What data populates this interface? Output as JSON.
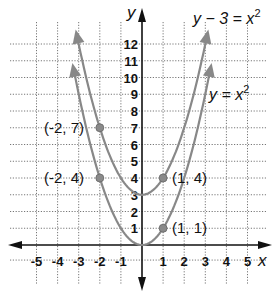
{
  "chart_data": {
    "type": "line",
    "title": "",
    "xlabel": "x",
    "ylabel": "y",
    "xlim": [
      -5,
      5
    ],
    "ylim": [
      0,
      12
    ],
    "grid": true,
    "x_ticks": [
      "-5",
      "-4",
      "-3",
      "-2",
      "-1",
      "1",
      "2",
      "3",
      "4",
      "5"
    ],
    "y_ticks": [
      "1",
      "2",
      "3",
      "4",
      "5",
      "6",
      "7",
      "8",
      "9",
      "10",
      "11",
      "12"
    ],
    "series": [
      {
        "name": "y - 3 = x^2",
        "equation_label": "y − 3 = x",
        "exponent": "2",
        "vertex": [
          0,
          3
        ],
        "points": [
          [
            -3,
            12
          ],
          [
            -2,
            7
          ],
          [
            -1,
            4
          ],
          [
            0,
            3
          ],
          [
            1,
            4
          ],
          [
            2,
            7
          ],
          [
            3,
            12
          ]
        ]
      },
      {
        "name": "y = x^2",
        "equation_label": "y = x",
        "exponent": "2",
        "vertex": [
          0,
          0
        ],
        "points": [
          [
            -3,
            9
          ],
          [
            -2,
            4
          ],
          [
            -1,
            1
          ],
          [
            0,
            0
          ],
          [
            1,
            1
          ],
          [
            2,
            4
          ],
          [
            3,
            9
          ]
        ]
      }
    ],
    "annotations": [
      {
        "label": "(-2, 7)",
        "x": -2,
        "y": 7
      },
      {
        "label": "(-2, 4)",
        "x": -2,
        "y": 4
      },
      {
        "label": "(1, 4)",
        "x": 1,
        "y": 4
      },
      {
        "label": "(1, 1)",
        "x": 1,
        "y": 1
      }
    ]
  },
  "labels": {
    "x_axis": "x",
    "y_axis": "y",
    "eq1": "y − 3 = x",
    "eq1_exp": "2",
    "eq2": "y = x",
    "eq2_exp": "2",
    "pt1": "(-2, 7)",
    "pt2": "(-2, 4)",
    "pt3": "(1, 4)",
    "pt4": "(1, 1)"
  }
}
